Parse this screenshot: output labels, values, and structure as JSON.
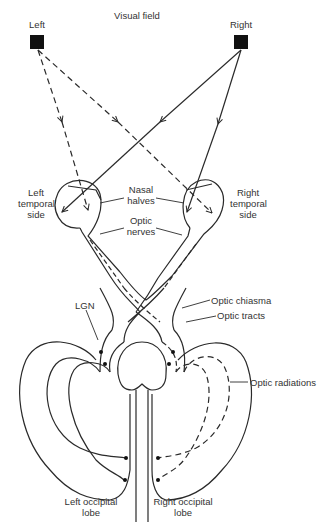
{
  "diagram": {
    "title": "Visual field",
    "colors": {
      "line": "#2a2a2a",
      "text": "#333333",
      "background": "#ffffff"
    },
    "visual_field": {
      "left_label": "Left",
      "right_label": "Right"
    },
    "labels": {
      "left_temporal": [
        "Left",
        "temporal",
        "side"
      ],
      "right_temporal": [
        "Right",
        "temporal",
        "side"
      ],
      "nasal_halves": [
        "Nasal",
        "halves"
      ],
      "optic_nerves": [
        "Optic",
        "nerves"
      ],
      "lgn": "LGN",
      "optic_chiasma": "Optic chiasma",
      "optic_tracts": "Optic tracts",
      "optic_radiations": "Optic radiations",
      "left_occipital": [
        "Left occipital",
        "lobe"
      ],
      "right_occipital": [
        "Right occipital",
        "lobe"
      ]
    },
    "legend_notes": {
      "dashed": "Pathway from left visual field object",
      "solid": "Pathway from right visual field object"
    }
  }
}
